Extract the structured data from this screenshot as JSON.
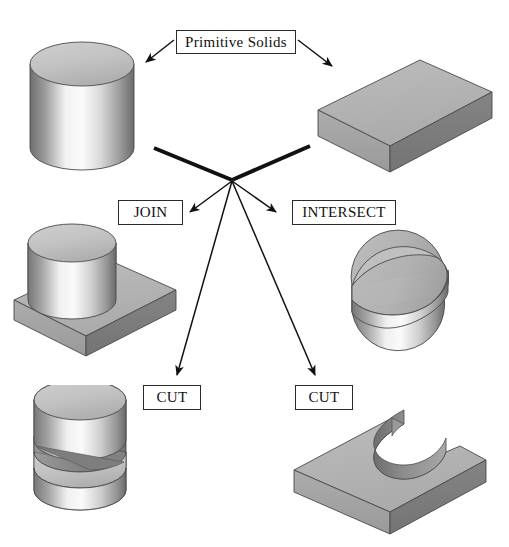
{
  "diagram": {
    "background_color": "#ffffff",
    "labels": {
      "primitive_solids": "Primitive Solids",
      "join": "JOIN",
      "intersect": "INTERSECT",
      "cut_left": "CUT",
      "cut_right": "CUT"
    },
    "shapes": [
      {
        "id": "cylinder-primitive",
        "name": "cylinder",
        "role": "primitive",
        "position": "top-left"
      },
      {
        "id": "block-primitive",
        "name": "rectangular-block",
        "role": "primitive",
        "position": "top-right"
      },
      {
        "id": "join-result",
        "name": "cylinder-union-block",
        "role": "result",
        "operation": "JOIN",
        "position": "middle-left"
      },
      {
        "id": "intersect-result",
        "name": "half-disc-wedge",
        "role": "result",
        "operation": "INTERSECT",
        "position": "middle-right"
      },
      {
        "id": "cut-left-result",
        "name": "cylinder-minus-block",
        "role": "result",
        "operation": "CUT",
        "position": "bottom-left"
      },
      {
        "id": "cut-right-result",
        "name": "block-minus-cylinder",
        "role": "result",
        "operation": "CUT",
        "position": "bottom-right"
      }
    ],
    "colors": {
      "ink": "#111111",
      "outline": "#2a2a2a",
      "face_light": "#d2d2d2",
      "face_mid": "#b4b4b4",
      "face_dark": "#808080",
      "face_darker": "#6e6e6e",
      "highlight": "#f4f4f4"
    },
    "connectors": [
      {
        "id": "primitive-to-cylinder",
        "from": "primitive_solids",
        "to": "cylinder-primitive",
        "style": "thin-arrow"
      },
      {
        "id": "primitive-to-block",
        "from": "primitive_solids",
        "to": "block-primitive",
        "style": "thin-arrow"
      },
      {
        "id": "cylinder-to-hub",
        "from": "cylinder-primitive",
        "to": "hub",
        "style": "thick-line"
      },
      {
        "id": "block-to-hub",
        "from": "block-primitive",
        "to": "hub",
        "style": "thick-line"
      },
      {
        "id": "hub-to-join",
        "from": "hub",
        "to": "join",
        "style": "thin-arrow"
      },
      {
        "id": "hub-to-intersect",
        "from": "hub",
        "to": "intersect",
        "style": "thin-arrow"
      },
      {
        "id": "hub-to-cut-left",
        "from": "hub",
        "to": "cut_left",
        "style": "thin-arrow"
      },
      {
        "id": "hub-to-cut-right",
        "from": "hub",
        "to": "cut_right",
        "style": "thin-arrow"
      }
    ]
  }
}
